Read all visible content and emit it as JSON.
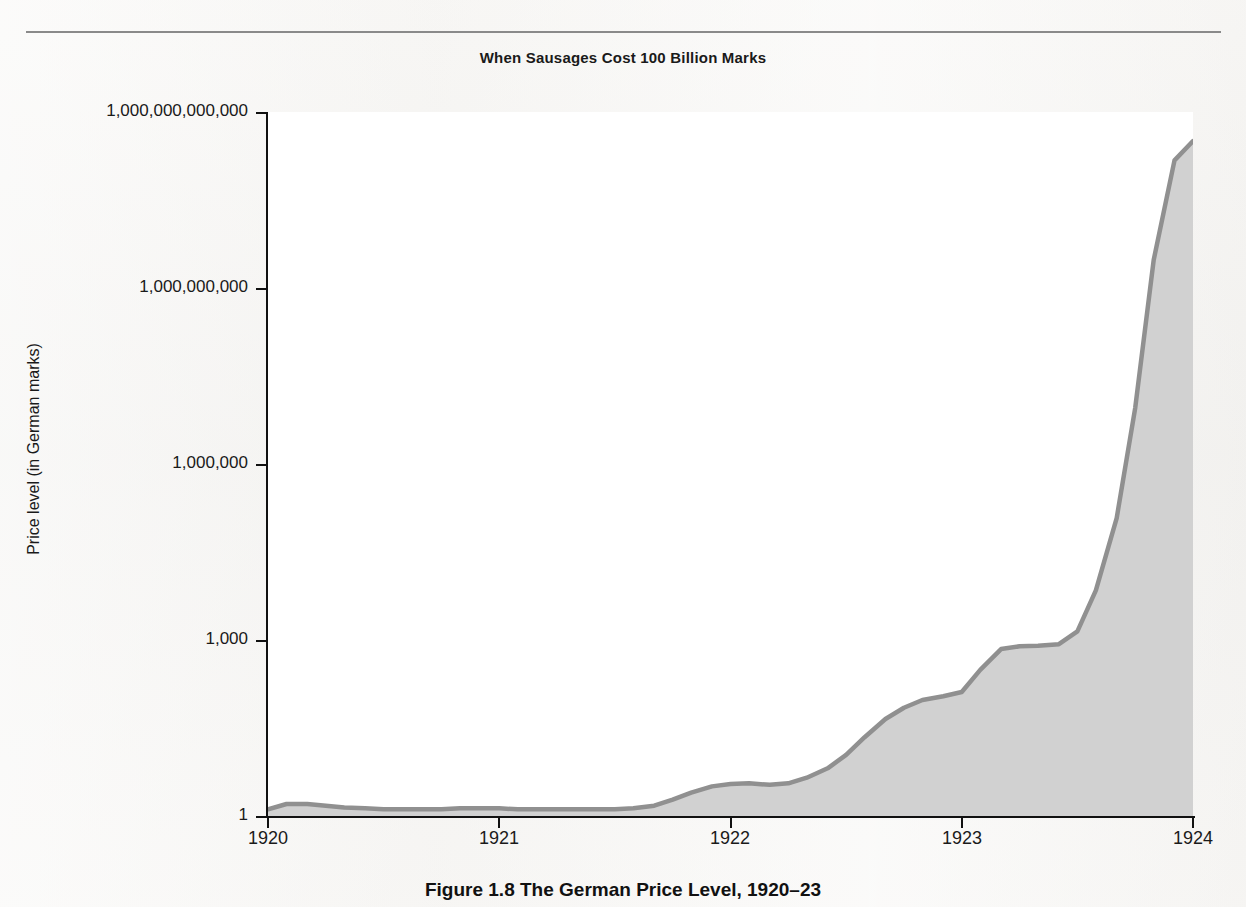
{
  "figure": {
    "chart_title": "When Sausages Cost 100 Billion Marks",
    "caption": "Figure 1.8 The German Price Level, 1920–23",
    "caption_number": "Figure 1.8",
    "caption_text": "The German Price Level, 1920–23",
    "colors": {
      "page_background": "#f2f1ef",
      "plot_background": "#ffffff",
      "area_fill": "#cccccc",
      "area_line": "#8f8f8f",
      "axis": "#111111",
      "text": "#1a1a1a",
      "rule": "#8a8a8a"
    }
  },
  "chart_data": {
    "type": "area",
    "title": "When Sausages Cost 100 Billion Marks",
    "xlabel": "",
    "ylabel": "Price level (in German marks)",
    "yscale": "log",
    "ylim": [
      1,
      1000000000000
    ],
    "xlim": [
      1920,
      1924
    ],
    "grid": false,
    "legend": "none",
    "y_tick_labels": [
      "1",
      "1,000",
      "1,000,000",
      "1,000,000,000",
      "1,000,000,000,000"
    ],
    "y_tick_values": [
      1,
      1000,
      1000000,
      1000000000,
      1000000000000
    ],
    "x_tick_labels": [
      "1920",
      "1921",
      "1922",
      "1923",
      "1924"
    ],
    "x_tick_values": [
      1920,
      1921,
      1922,
      1923,
      1924
    ],
    "series": [
      {
        "name": "German price level",
        "x": [
          1920.0,
          1920.08,
          1920.17,
          1920.25,
          1920.33,
          1920.42,
          1920.5,
          1920.58,
          1920.67,
          1920.75,
          1920.83,
          1920.92,
          1921.0,
          1921.08,
          1921.17,
          1921.25,
          1921.33,
          1921.42,
          1921.5,
          1921.58,
          1921.67,
          1921.75,
          1921.83,
          1921.92,
          1922.0,
          1922.08,
          1922.17,
          1922.25,
          1922.33,
          1922.42,
          1922.5,
          1922.58,
          1922.67,
          1922.75,
          1922.83,
          1922.92,
          1923.0,
          1923.08,
          1923.17,
          1923.25,
          1923.33,
          1923.42,
          1923.5,
          1923.58,
          1923.67,
          1923.75,
          1923.83,
          1923.92,
          1924.0
        ],
        "y": [
          1.3,
          1.6,
          1.6,
          1.5,
          1.4,
          1.35,
          1.3,
          1.3,
          1.3,
          1.3,
          1.35,
          1.35,
          1.35,
          1.3,
          1.3,
          1.3,
          1.3,
          1.3,
          1.3,
          1.35,
          1.5,
          1.9,
          2.5,
          3.2,
          3.5,
          3.6,
          3.4,
          3.6,
          4.5,
          6.5,
          11,
          22,
          45,
          70,
          95,
          110,
          130,
          310,
          700,
          780,
          800,
          850,
          1400,
          7000,
          120000,
          9000000,
          3000000000,
          150000000000,
          320000000000
        ],
        "annotation": "Hyperinflation: price level rises from about 1 mark in 1920 to several hundred billion marks by the end of 1923"
      }
    ]
  },
  "axes": {
    "y_title": "Price level (in German marks)",
    "y_ticks": [
      {
        "label": "1,000,000,000,000",
        "top_px": 112
      },
      {
        "label": "1,000,000,000",
        "top_px": 288
      },
      {
        "label": "1,000,000",
        "top_px": 464
      },
      {
        "label": "1,000",
        "top_px": 640
      },
      {
        "label": "1",
        "top_px": 816
      }
    ],
    "x_ticks": [
      {
        "label": "1920",
        "left_px": 268
      },
      {
        "label": "1921",
        "left_px": 499
      },
      {
        "label": "1922",
        "left_px": 730
      },
      {
        "label": "1923",
        "left_px": 962
      },
      {
        "label": "1924",
        "left_px": 1193
      }
    ]
  }
}
